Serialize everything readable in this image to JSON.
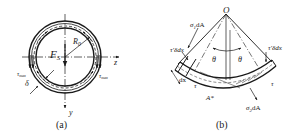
{
  "figure_a": {
    "caption": "(a)",
    "labels": {
      "shear_force": "F",
      "shear_force_sub": "S",
      "radius": "R",
      "radius_sub": "0",
      "axis_z": "z",
      "axis_y": "y",
      "tau_max_left": "τ",
      "tau_max_left_sub": "max",
      "tau_max_right": "τ",
      "tau_max_right_sub": "max",
      "thickness": "δ"
    }
  },
  "figure_b": {
    "caption": "(b)",
    "labels": {
      "origin": "O",
      "sigma1": "σ",
      "sigma1_sub": "1",
      "sigma1_tail": "dA",
      "tau_prime_left": "τ′δdx",
      "tau_prime_right": "τ′δdx",
      "theta_left": "θ",
      "theta_right": "θ",
      "dx": "dx",
      "tau_left": "τ",
      "tau_right": "τ",
      "area": "A*",
      "sigma2": "σ",
      "sigma2_sub": "2",
      "sigma2_tail": "dA"
    }
  },
  "colors": {
    "stroke": "#1a1a1a",
    "background": "#ffffff"
  }
}
